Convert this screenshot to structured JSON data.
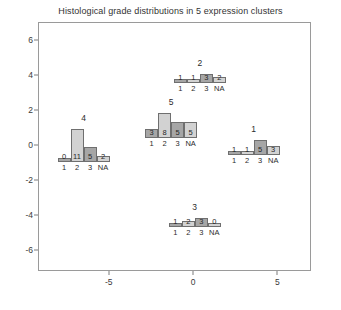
{
  "chart_data": {
    "type": "bar",
    "title": "Histological grade distributions in 5 expression clusters",
    "xlabel": "",
    "ylabel": "",
    "xlim": [
      -9.2,
      7.0
    ],
    "ylim": [
      -7.2,
      7.0
    ],
    "xticks": [
      "-5",
      "0",
      "5"
    ],
    "xtick_values": [
      -5,
      0,
      5
    ],
    "yticks": [
      "6",
      "4",
      "2",
      "0",
      "-2",
      "-4",
      "-6"
    ],
    "ytick_values": [
      6,
      4,
      2,
      0,
      -2,
      -4,
      -6
    ],
    "grid": false,
    "legend": null,
    "categories": [
      "1",
      "2",
      "3",
      "NA"
    ],
    "series": [
      {
        "name": "4",
        "cluster_label": "4",
        "x": -6.5,
        "y": -1.0,
        "values": [
          0,
          11,
          5,
          2
        ]
      },
      {
        "name": "5",
        "cluster_label": "5",
        "x": -1.3,
        "y": 0.4,
        "values": [
          3,
          8,
          5,
          5
        ]
      },
      {
        "name": "2",
        "cluster_label": "2",
        "x": 0.4,
        "y": 3.5,
        "values": [
          1,
          1,
          3,
          2
        ]
      },
      {
        "name": "1",
        "cluster_label": "1",
        "x": 3.6,
        "y": -0.6,
        "values": [
          1,
          1,
          5,
          3
        ]
      },
      {
        "name": "3",
        "cluster_label": "3",
        "x": 0.1,
        "y": -4.7,
        "values": [
          1,
          2,
          3,
          0
        ]
      }
    ],
    "bar_colors": {
      "dark": "#a6a6a6",
      "light": "#d2d2d2",
      "border": "#6f6f6f"
    },
    "frame_color": "#9a9a9a",
    "background": "#ffffff"
  }
}
